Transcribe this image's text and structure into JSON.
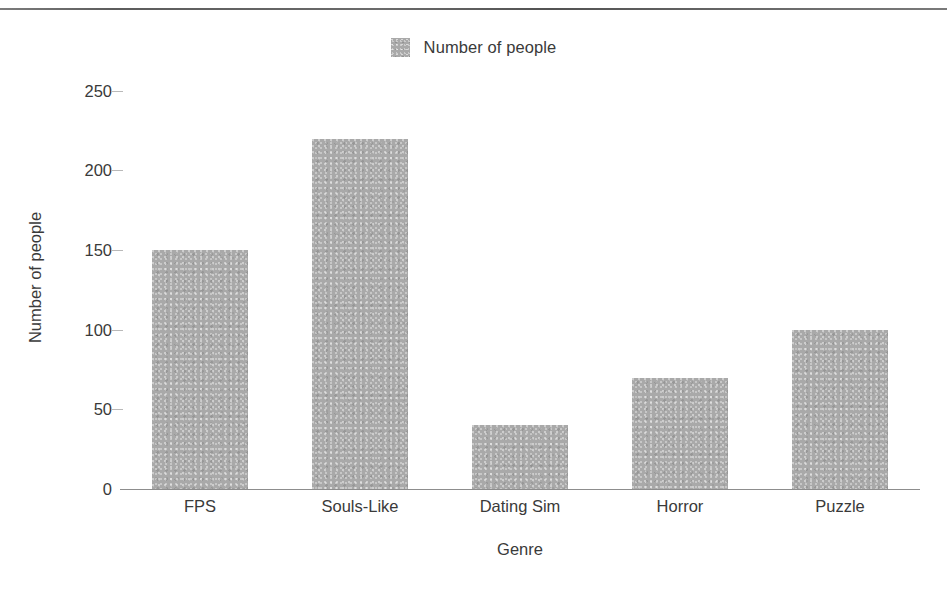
{
  "chart_data": {
    "type": "bar",
    "title": "",
    "subtitle": "",
    "xlabel": "Genre",
    "ylabel": "Number of people",
    "categories": [
      "FPS",
      "Souls-Like",
      "Dating Sim",
      "Horror",
      "Puzzle"
    ],
    "values": [
      150,
      220,
      40,
      70,
      100
    ],
    "series": [
      {
        "name": "Number of people",
        "values": [
          150,
          220,
          40,
          70,
          100
        ],
        "color": "#a9a9a9"
      }
    ],
    "ylim": [
      0,
      250
    ],
    "ytick_labels": [
      "0",
      "50",
      "100",
      "150",
      "200",
      "250"
    ],
    "ytick_values": [
      0,
      50,
      100,
      150,
      200,
      250
    ],
    "grid": false,
    "legend": {
      "position": "top-center",
      "entries": [
        {
          "label": "Number of people",
          "color": "#a9a9a9"
        }
      ]
    },
    "colors": {
      "bar_fill": "#a9a9a9",
      "axis_line": "#8d8d8d",
      "text": "#3a3a3a",
      "background": "#ffffff"
    }
  }
}
